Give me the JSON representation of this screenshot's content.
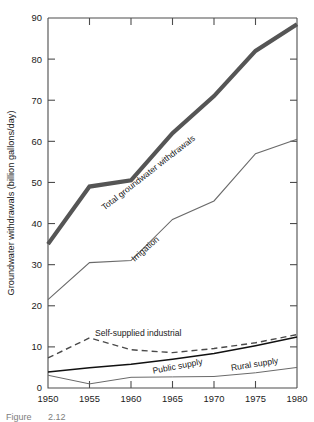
{
  "figure": {
    "caption": "Figure",
    "caption_number": "2.12"
  },
  "chart_data": {
    "type": "line",
    "title": "",
    "subtitle": "",
    "xlabel": "",
    "ylabel": "Groundwater withdrawals (billion gallons/day)",
    "x": [
      1950,
      1955,
      1960,
      1965,
      1970,
      1975,
      1980
    ],
    "xtick_labels": [
      "1950",
      "1955",
      "1960",
      "1965",
      "1970",
      "1975",
      "1980"
    ],
    "ytick_labels": [
      "0",
      "10",
      "20",
      "30",
      "40",
      "50",
      "60",
      "70",
      "80",
      "90"
    ],
    "yticks": [
      0,
      10,
      20,
      30,
      40,
      50,
      60,
      70,
      80,
      90
    ],
    "xlim": [
      1950,
      1980
    ],
    "ylim": [
      0,
      90
    ],
    "grid": false,
    "legend": "inline-annotations",
    "series": [
      {
        "name": "Total groundwater withdrawals",
        "label": "Total groundwater withdrawals",
        "style": "solid-thick",
        "color": "#555555",
        "width": 4.2,
        "values": [
          35,
          49,
          50.5,
          62,
          71,
          82,
          88.5
        ]
      },
      {
        "name": "Irrigation",
        "label": "Irrigation",
        "style": "solid-thin",
        "color": "#6a6a6a",
        "width": 1.1,
        "values": [
          21.5,
          30.5,
          31,
          41,
          45.5,
          57,
          60.5
        ]
      },
      {
        "name": "Self-supplied industrial",
        "label": "Self-supplied industrial",
        "style": "dashed",
        "color": "#4a4a4a",
        "width": 1.4,
        "values": [
          7.3,
          12.2,
          9.3,
          8.6,
          9.6,
          11,
          13
        ]
      },
      {
        "name": "Public supply",
        "label": "Public supply",
        "style": "solid-black",
        "color": "#111111",
        "width": 1.5,
        "values": [
          3.9,
          4.9,
          5.8,
          7.0,
          8.4,
          10.3,
          12.4
        ]
      },
      {
        "name": "Rural supply",
        "label": "Rural supply",
        "style": "solid-thin",
        "color": "#6a6a6a",
        "width": 1.0,
        "values": [
          3.1,
          1.0,
          2.6,
          2.7,
          2.8,
          3.7,
          5.0
        ]
      }
    ],
    "annotations": [
      {
        "text": "Total groundwater withdrawals",
        "rotation": -38
      },
      {
        "text": "Irrigation",
        "rotation": -41
      },
      {
        "text": "Self-supplied industrial",
        "rotation": 0
      },
      {
        "text": "Public supply",
        "rotation": -11
      },
      {
        "text": "Rural supply",
        "rotation": -9
      }
    ]
  }
}
